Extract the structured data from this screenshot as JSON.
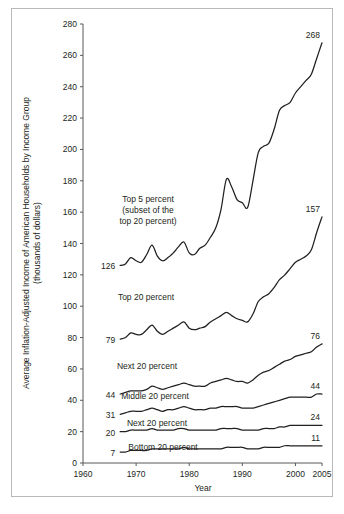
{
  "chart_data": {
    "type": "line",
    "title": "",
    "xlabel": "Year",
    "ylabel": "Average Inflation-Adjusted Income of American Households by Income Group (thousands of dollars)",
    "ylabel_line1": "Average Inflation-Adjusted Income of American Households by Income Group",
    "ylabel_line2": "(thousands of dollars)",
    "xlim": [
      1960,
      2005
    ],
    "ylim": [
      0,
      280
    ],
    "grid": false,
    "legend_position": "inline-annotations",
    "xticks": [
      1960,
      1970,
      1980,
      1990,
      2000,
      2005
    ],
    "xtick_labels": [
      "1960",
      "1970",
      "1980",
      "1990",
      "2000",
      "2005"
    ],
    "yticks": [
      0,
      20,
      40,
      60,
      80,
      100,
      120,
      140,
      160,
      180,
      200,
      220,
      240,
      260,
      280
    ],
    "ytick_labels": [
      "0",
      "20",
      "40",
      "60",
      "80",
      "100",
      "120",
      "140",
      "160",
      "180",
      "200",
      "220",
      "240",
      "260",
      "280"
    ],
    "x": [
      1967,
      1968,
      1969,
      1970,
      1971,
      1972,
      1973,
      1974,
      1975,
      1976,
      1977,
      1978,
      1979,
      1980,
      1981,
      1982,
      1983,
      1984,
      1985,
      1986,
      1987,
      1988,
      1989,
      1990,
      1991,
      1992,
      1993,
      1994,
      1995,
      1996,
      1997,
      1998,
      1999,
      2000,
      2001,
      2002,
      2003,
      2004,
      2005
    ],
    "series": [
      {
        "name": "Top 5 percent",
        "label": "Top 5 percent",
        "annotation": "Top 5 percent (subset of the top 20 percent)",
        "annotation_lines": [
          "Top 5 percent",
          "(subset of the",
          "top 20 percent)"
        ],
        "start_value": 126,
        "end_value": 268,
        "start_label": "126",
        "end_label": "268",
        "values": [
          126,
          127,
          131,
          129,
          128,
          133,
          139,
          132,
          129,
          131,
          134,
          138,
          141,
          134,
          133,
          137,
          139,
          144,
          150,
          162,
          181,
          176,
          168,
          166,
          163,
          180,
          198,
          202,
          204,
          213,
          225,
          228,
          230,
          236,
          240,
          244,
          248,
          258,
          268
        ]
      },
      {
        "name": "Top 20 percent",
        "label": "Top 20 percent",
        "start_value": 79,
        "end_value": 157,
        "start_label": "79",
        "end_label": "157",
        "values": [
          79,
          80,
          83,
          82,
          82,
          85,
          88,
          84,
          82,
          84,
          86,
          88,
          90,
          86,
          85,
          86,
          87,
          90,
          92,
          94,
          96,
          94,
          92,
          91,
          90,
          95,
          103,
          106,
          108,
          112,
          117,
          120,
          124,
          128,
          130,
          132,
          136,
          147,
          157
        ]
      },
      {
        "name": "Next 20 percent (fourth quintile)",
        "label": "Next 20 percent",
        "start_value": 44,
        "end_value": 76,
        "start_label": "44",
        "end_label": "76",
        "values": [
          44,
          45,
          46,
          46,
          46,
          47,
          49,
          48,
          47,
          48,
          49,
          50,
          51,
          50,
          49,
          49,
          49,
          51,
          52,
          53,
          54,
          53,
          52,
          52,
          51,
          53,
          56,
          58,
          59,
          61,
          63,
          65,
          66,
          68,
          69,
          70,
          71,
          74,
          76
        ]
      },
      {
        "name": "Middle 20 percent",
        "label": "Middle 20 percent",
        "start_value": 31,
        "end_value": 44,
        "start_label": "31",
        "end_label": "44",
        "values": [
          31,
          32,
          33,
          33,
          33,
          34,
          35,
          34,
          33,
          34,
          34,
          35,
          36,
          35,
          34,
          34,
          34,
          35,
          35,
          36,
          36,
          36,
          36,
          35,
          35,
          35,
          36,
          37,
          38,
          39,
          40,
          41,
          42,
          42,
          42,
          42,
          42,
          44,
          44
        ]
      },
      {
        "name": "Next 20 percent (second quintile)",
        "label": "Next 20 percent",
        "start_value": 20,
        "end_value": 24,
        "start_label": "20",
        "end_label": "24",
        "values": [
          20,
          20,
          21,
          21,
          21,
          21,
          22,
          21,
          21,
          21,
          21,
          22,
          22,
          21,
          21,
          21,
          21,
          21,
          21,
          22,
          22,
          22,
          22,
          21,
          21,
          21,
          21,
          22,
          22,
          22,
          23,
          23,
          24,
          24,
          24,
          24,
          24,
          24,
          24
        ]
      },
      {
        "name": "Bottom 20 percent",
        "label": "Bottom 20 percent",
        "start_value": 7,
        "end_value": 11,
        "start_label": "7",
        "end_label": "11",
        "values": [
          7,
          7,
          8,
          8,
          8,
          8,
          9,
          9,
          9,
          9,
          9,
          9,
          10,
          9,
          9,
          9,
          9,
          9,
          9,
          9,
          10,
          10,
          10,
          10,
          9,
          9,
          9,
          10,
          10,
          10,
          10,
          11,
          11,
          11,
          11,
          11,
          11,
          11,
          11
        ]
      }
    ]
  },
  "colors": {
    "line": "#231f20",
    "axis": "#58595b",
    "frame": "#b9b9b9",
    "background": "#ffffff"
  }
}
